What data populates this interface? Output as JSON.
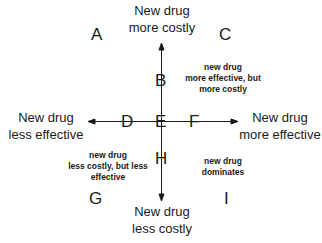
{
  "diagram": {
    "type": "cost-effectiveness plane",
    "axis_labels": {
      "top": [
        "New drug",
        "more costly"
      ],
      "bottom": [
        "New drug",
        "less costly"
      ],
      "left": [
        "New drug",
        "less effective"
      ],
      "right": [
        "New drug",
        "more effective"
      ]
    },
    "cells": {
      "A": "A",
      "B": "B",
      "C": "C",
      "D": "D",
      "E": "E",
      "F": "F",
      "G": "G",
      "H": "H",
      "I": "I"
    },
    "notes": {
      "upper_right": [
        "new drug",
        "more effective, but",
        "more costly"
      ],
      "lower_left": [
        "new drug",
        "less costly, but less",
        "effective"
      ],
      "lower_right": [
        "new drug",
        "dominates"
      ]
    },
    "colors": {
      "axis": "#1a1a1a",
      "text": "#1a1a1a",
      "background": "#ffffff"
    }
  }
}
